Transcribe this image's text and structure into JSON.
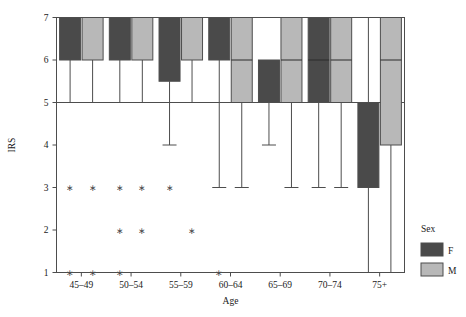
{
  "chart_data": {
    "type": "box",
    "title": "",
    "xlabel": "Age",
    "ylabel": "IRS",
    "categories": [
      "45–49",
      "50–54",
      "55–59",
      "60–64",
      "65–69",
      "70–74",
      "75+"
    ],
    "ylim": [
      1,
      7
    ],
    "yticks": [
      1,
      2,
      3,
      4,
      5,
      6,
      7
    ],
    "ytick_labels": [
      "1",
      "2",
      "3",
      "4",
      "5",
      "6",
      "7"
    ],
    "grid": false,
    "reference_lines": [
      {
        "y": 5,
        "orientation": "horizontal"
      }
    ],
    "legend": {
      "title": "Sex",
      "position": "right",
      "entries": [
        {
          "label": "F",
          "color": "#4a4a4a"
        },
        {
          "label": "M",
          "color": "#b8b8b8"
        }
      ]
    },
    "series": [
      {
        "name": "F",
        "color": "#4a4a4a",
        "boxes": [
          {
            "category": "45–49",
            "q1": 6,
            "median": 7,
            "q3": 7,
            "lower_whisker": 5,
            "upper_whisker": 7,
            "outliers": [
              3,
              1
            ]
          },
          {
            "category": "50–54",
            "q1": 6,
            "median": 7,
            "q3": 7,
            "lower_whisker": 5,
            "upper_whisker": 7,
            "outliers": [
              3,
              2,
              1
            ]
          },
          {
            "category": "55–59",
            "q1": 5.5,
            "median": 7,
            "q3": 7,
            "lower_whisker": 4,
            "upper_whisker": 7,
            "outliers": [
              3
            ]
          },
          {
            "category": "60–64",
            "q1": 6,
            "median": 7,
            "q3": 7,
            "lower_whisker": 3,
            "upper_whisker": 7,
            "outliers": [
              1
            ]
          },
          {
            "category": "65–69",
            "q1": 5,
            "median": 6,
            "q3": 6,
            "lower_whisker": 4,
            "upper_whisker": 6,
            "outliers": []
          },
          {
            "category": "70–74",
            "q1": 5,
            "median": 6,
            "q3": 7,
            "lower_whisker": 3,
            "upper_whisker": 7,
            "outliers": []
          },
          {
            "category": "75+",
            "q1": 3,
            "median": 5,
            "q3": 5,
            "lower_whisker": 1,
            "upper_whisker": 7,
            "outliers": []
          }
        ]
      },
      {
        "name": "M",
        "color": "#b8b8b8",
        "boxes": [
          {
            "category": "45–49",
            "q1": 6,
            "median": 7,
            "q3": 7,
            "lower_whisker": 5,
            "upper_whisker": 7,
            "outliers": [
              3,
              1
            ]
          },
          {
            "category": "50–54",
            "q1": 6,
            "median": 7,
            "q3": 7,
            "lower_whisker": 5,
            "upper_whisker": 7,
            "outliers": [
              3,
              2
            ]
          },
          {
            "category": "55–59",
            "q1": 6,
            "median": 7,
            "q3": 7,
            "lower_whisker": 5,
            "upper_whisker": 7,
            "outliers": [
              2
            ]
          },
          {
            "category": "60–64",
            "q1": 5,
            "median": 6,
            "q3": 7,
            "lower_whisker": 3,
            "upper_whisker": 7,
            "outliers": []
          },
          {
            "category": "65–69",
            "q1": 5,
            "median": 6,
            "q3": 7,
            "lower_whisker": 3,
            "upper_whisker": 7,
            "outliers": []
          },
          {
            "category": "70–74",
            "q1": 5,
            "median": 6,
            "q3": 7,
            "lower_whisker": 3,
            "upper_whisker": 7,
            "outliers": []
          },
          {
            "category": "75+",
            "q1": 4,
            "median": 6,
            "q3": 7,
            "lower_whisker": 1,
            "upper_whisker": 7,
            "outliers": []
          }
        ]
      }
    ],
    "outlier_marker": "asterisk"
  },
  "colors": {
    "female": "#4a4a4a",
    "male": "#b8b8b8",
    "axis": "#4d4d4d",
    "background": "#ffffff"
  }
}
